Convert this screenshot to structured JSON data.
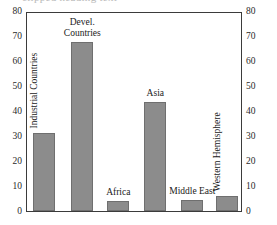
{
  "chart_data": {
    "type": "bar",
    "title": "",
    "xlabel": "",
    "ylabel": "",
    "ylim": [
      0,
      80
    ],
    "ytick_step": 10,
    "grid": false,
    "legend": null,
    "dual_axis": true,
    "categories": [
      "Industrial Countries",
      "Devel. Countries",
      "Africa",
      "Asia",
      "Middle East",
      "Western Hemisphere"
    ],
    "values": [
      31.5,
      68.5,
      4,
      44,
      4.5,
      6
    ],
    "yticks_left": [
      "0",
      "10",
      "20",
      "30",
      "40",
      "50",
      "60",
      "70",
      "80"
    ],
    "yticks_right": [
      "0",
      "10",
      "20",
      "30",
      "40",
      "50",
      "60",
      "70",
      "80"
    ],
    "bar_color": "#8c8c8c",
    "bar_edge_color": "#6f6f6f",
    "frame_color": "#3b3b3b",
    "background": "#ffffff"
  },
  "labels": {
    "industrial_countries": "Industrial Countries",
    "devel_line1": "Devel.",
    "devel_line2": "Countries",
    "africa": "Africa",
    "asia": "Asia",
    "middle_east": "Middle East",
    "western_hemisphere": "Western Hemisphere"
  },
  "axis_left": {
    "t0": "0",
    "t10": "10",
    "t20": "20",
    "t30": "30",
    "t40": "40",
    "t50": "50",
    "t60": "60",
    "t70": "70",
    "t80": "80"
  },
  "axis_right": {
    "t0": "0",
    "t10": "10",
    "t20": "20",
    "t30": "30",
    "t40": "40",
    "t50": "50",
    "t60": "60",
    "t70": "70",
    "t80": "80"
  },
  "title_sliver": {
    "clipped_text": "clipped heading text"
  }
}
